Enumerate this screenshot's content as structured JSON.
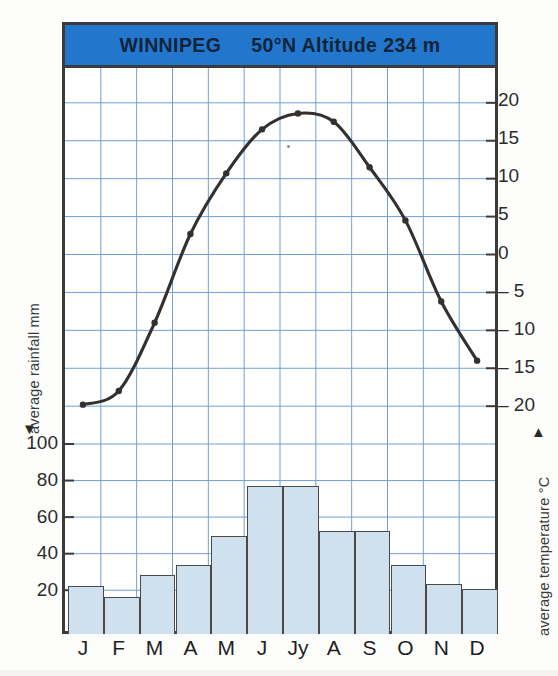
{
  "header": {
    "station": "WINNIPEG",
    "coords_altitude": "50°N Altitude 234 m",
    "band_color": "#2277cc"
  },
  "axes": {
    "left_title": "average rainfall mm",
    "left_arrow": "▼",
    "right_title": "average temperature °C",
    "right_arrow": "▲",
    "rainfall_ticks": [
      "100",
      "80",
      "60",
      "40",
      "20"
    ],
    "temperature_ticks": [
      "20",
      "15",
      "10",
      "5",
      "0",
      "– 5",
      "– 10",
      "– 15",
      "– 20"
    ]
  },
  "months": [
    "J",
    "F",
    "M",
    "A",
    "M",
    "J",
    "Jy",
    "A",
    "S",
    "O",
    "N",
    "D"
  ],
  "chart_data": {
    "type": "bar",
    "title": "WINNIPEG 50°N Altitude 234 m",
    "xlabel": "",
    "grid": true,
    "legend": "none",
    "categories": [
      "J",
      "F",
      "M",
      "A",
      "M",
      "J",
      "Jy",
      "A",
      "S",
      "O",
      "N",
      "D"
    ],
    "series": [
      {
        "name": "average rainfall mm",
        "type": "bar",
        "axis": "left",
        "ylabel": "average rainfall mm",
        "ylim": [
          0,
          110
        ],
        "yticks": [
          20,
          40,
          60,
          80,
          100
        ],
        "color": "#cfe0ee",
        "values": [
          24,
          18,
          30,
          35,
          51,
          78,
          78,
          54,
          54,
          35,
          25,
          22
        ]
      },
      {
        "name": "average temperature °C",
        "type": "line",
        "axis": "right",
        "ylabel": "average temperature °C",
        "ylim": [
          -22,
          22
        ],
        "yticks": [
          -20,
          -15,
          -10,
          -5,
          0,
          5,
          10,
          15,
          20
        ],
        "color": "#33302e",
        "values": [
          -19.8,
          -18.0,
          -9.0,
          2.7,
          10.7,
          16.5,
          18.6,
          17.5,
          11.5,
          4.5,
          -6.2,
          -14.0
        ]
      }
    ]
  }
}
